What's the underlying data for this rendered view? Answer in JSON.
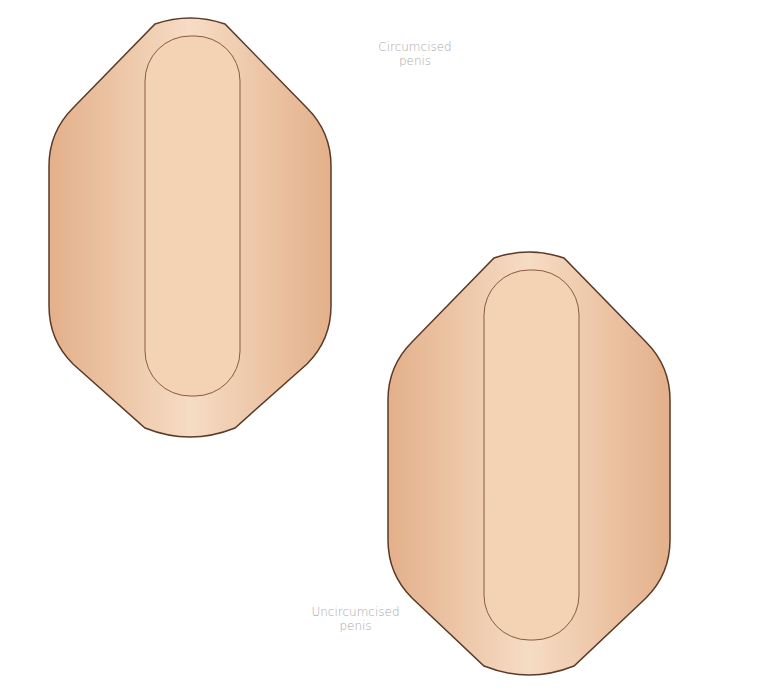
{
  "diagram": {
    "panels": [
      {
        "id": "circumcised",
        "label_line1": "Circumcised",
        "label_line2": "penis"
      },
      {
        "id": "uncircumcised",
        "label_line1": "Uncircumcised",
        "label_line2": "penis"
      }
    ],
    "colors": {
      "skin_light": "#f6dcc4",
      "skin_mid": "#e9b991",
      "skin_dark": "#c98a63",
      "outline": "#8a5a3c",
      "label_text": "#a8a8a8"
    }
  }
}
